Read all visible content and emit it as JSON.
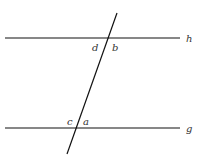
{
  "diagram": {
    "lines": {
      "h": {
        "label": "h",
        "x1": 5,
        "y1": 38,
        "x2": 180,
        "y2": 38
      },
      "g": {
        "label": "g",
        "x1": 5,
        "y1": 128,
        "x2": 180,
        "y2": 128
      },
      "transversal": {
        "x1": 117,
        "y1": 13,
        "x2": 67,
        "y2": 154
      }
    },
    "angle_labels": {
      "d": "d",
      "b": "b",
      "c": "c",
      "a": "a"
    },
    "colors": {
      "stroke": "#111111",
      "label": "#333333"
    }
  }
}
